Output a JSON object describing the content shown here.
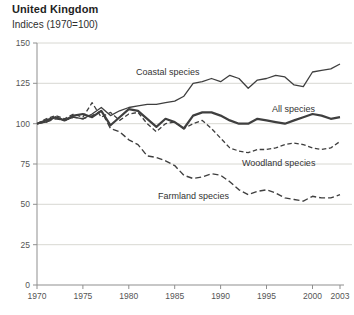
{
  "chart_data": {
    "type": "line",
    "title": "United Kingdom",
    "subtitle": "Indices (1970=100)",
    "xlabel": "",
    "ylabel": "",
    "xlim": [
      1970,
      2003
    ],
    "ylim": [
      0,
      150
    ],
    "x_ticks": [
      1970,
      1975,
      1980,
      1985,
      1990,
      1995,
      2000,
      2003
    ],
    "y_ticks": [
      0,
      25,
      50,
      75,
      100,
      125,
      150
    ],
    "grid": "horizontal",
    "legend": "inline-labels-on-lines",
    "years": [
      1970,
      1971,
      1972,
      1973,
      1974,
      1975,
      1976,
      1977,
      1978,
      1979,
      1980,
      1981,
      1982,
      1983,
      1984,
      1985,
      1986,
      1987,
      1988,
      1989,
      1990,
      1991,
      1992,
      1993,
      1994,
      1995,
      1996,
      1997,
      1998,
      1999,
      2000,
      2001,
      2002,
      2003
    ],
    "series": [
      {
        "name": "Coastal species",
        "line_style": "solid",
        "dash": "none",
        "width": 1.3,
        "label_pos": [
          136,
          75
        ],
        "values": [
          100,
          101,
          104,
          102,
          104,
          103,
          106,
          110,
          105,
          108,
          110,
          111,
          112,
          112,
          113,
          114,
          117,
          125,
          126,
          128,
          126,
          130,
          128,
          122,
          127,
          128,
          130,
          129,
          124,
          123,
          132,
          133,
          134,
          137
        ]
      },
      {
        "name": "All species",
        "line_style": "solid-bold",
        "dash": "none",
        "width": 2.2,
        "label_pos": [
          272,
          112
        ],
        "values": [
          100,
          102,
          104,
          102,
          105,
          106,
          104,
          108,
          99,
          104,
          109,
          108,
          103,
          98,
          103,
          101,
          97,
          105,
          107,
          107,
          105,
          102,
          100,
          100,
          103,
          102,
          101,
          100,
          102,
          104,
          106,
          105,
          103,
          104
        ]
      },
      {
        "name": "Woodland species",
        "line_style": "dashed",
        "dash": "4.5 2.6",
        "width": 1.3,
        "label_pos": [
          242,
          166
        ],
        "values": [
          100,
          103,
          105,
          103,
          106,
          104,
          113,
          104,
          107,
          102,
          106,
          107,
          100,
          95,
          100,
          101,
          97,
          100,
          102,
          97,
          91,
          85,
          83,
          82,
          84,
          84,
          85,
          87,
          88,
          87,
          85,
          84,
          85,
          89
        ]
      },
      {
        "name": "Farmland species",
        "line_style": "dashed",
        "dash": "6 3",
        "width": 1.4,
        "label_pos": [
          158,
          199
        ],
        "values": [
          100,
          101,
          103,
          102,
          104,
          103,
          105,
          108,
          97,
          95,
          90,
          87,
          80,
          79,
          77,
          74,
          68,
          66,
          67,
          69,
          68,
          64,
          59,
          56,
          58,
          59,
          57,
          54,
          53,
          52,
          55,
          54,
          54,
          56
        ]
      }
    ],
    "colors": {
      "line": "#3f3f3f",
      "grid": "#d8d8d2",
      "axis": "#8f8f8f",
      "tick_text": "#555555",
      "label_text": "#333333"
    }
  }
}
